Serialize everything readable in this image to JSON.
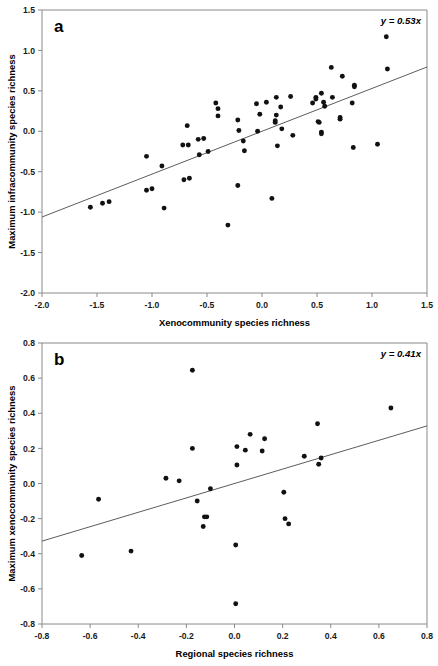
{
  "figure": {
    "type": "scatter-figure",
    "panel_count": 2,
    "background_color": "#ffffff",
    "point_color": "#111111",
    "line_color": "#4a4a4a",
    "axis_color": "#8a8a8a"
  },
  "chart_data": [
    {
      "type": "scatter",
      "panel_label": "a",
      "title": "",
      "xlabel": "Xenocommunity species richness",
      "ylabel": "Maximum infracommunity species richness",
      "xlim": [
        -2.0,
        1.5
      ],
      "ylim": [
        -2.0,
        1.5
      ],
      "xticks": [
        -2.0,
        -1.5,
        -1.0,
        -0.5,
        0.0,
        0.5,
        1.0,
        1.5
      ],
      "xtick_labels": [
        "-2.0",
        "-1.5",
        "-1.0",
        "-0.5",
        "0.0",
        "0.5",
        "1.0",
        "1.5"
      ],
      "yticks": [
        -2.0,
        -1.5,
        -1.0,
        -0.5,
        0.0,
        0.5,
        1.0,
        1.5
      ],
      "ytick_labels": [
        "-2.0",
        "-1.5",
        "-1.0",
        "-0.5",
        "0.0",
        "0.5",
        "1.0",
        "1.5"
      ],
      "grid": false,
      "legend": "none",
      "annotation": "y = 0.53x",
      "annotation_position": "top-right",
      "fit": {
        "equation": "y = 0.53x",
        "slope": 0.53,
        "intercept": 0.0
      },
      "points": [
        [
          -1.56,
          -0.94
        ],
        [
          -1.45,
          -0.89
        ],
        [
          -1.39,
          -0.87
        ],
        [
          -1.05,
          -0.31
        ],
        [
          -1.05,
          -0.73
        ],
        [
          -1.0,
          -0.71
        ],
        [
          -0.91,
          -0.43
        ],
        [
          -0.89,
          -0.95
        ],
        [
          -0.72,
          -0.17
        ],
        [
          -0.71,
          -0.6
        ],
        [
          -0.68,
          0.07
        ],
        [
          -0.67,
          -0.17
        ],
        [
          -0.66,
          -0.58
        ],
        [
          -0.58,
          -0.1
        ],
        [
          -0.57,
          -0.29
        ],
        [
          -0.53,
          -0.09
        ],
        [
          -0.49,
          -0.25
        ],
        [
          -0.42,
          0.35
        ],
        [
          -0.4,
          0.28
        ],
        [
          -0.4,
          0.19
        ],
        [
          -0.31,
          -1.16
        ],
        [
          -0.22,
          0.14
        ],
        [
          -0.22,
          -0.67
        ],
        [
          -0.21,
          0.01
        ],
        [
          -0.17,
          -0.12
        ],
        [
          -0.16,
          -0.24
        ],
        [
          -0.05,
          0.34
        ],
        [
          -0.04,
          0.0
        ],
        [
          -0.02,
          0.21
        ],
        [
          0.04,
          0.36
        ],
        [
          0.09,
          -0.83
        ],
        [
          0.12,
          0.13
        ],
        [
          0.12,
          0.11
        ],
        [
          0.13,
          0.42
        ],
        [
          0.13,
          0.2
        ],
        [
          0.14,
          -0.18
        ],
        [
          0.17,
          0.3
        ],
        [
          0.18,
          0.03
        ],
        [
          0.26,
          0.43
        ],
        [
          0.28,
          -0.05
        ],
        [
          0.46,
          0.35
        ],
        [
          0.49,
          0.42
        ],
        [
          0.49,
          0.4
        ],
        [
          0.51,
          0.12
        ],
        [
          0.52,
          0.11
        ],
        [
          0.54,
          0.47
        ],
        [
          0.54,
          -0.01
        ],
        [
          0.54,
          -0.03
        ],
        [
          0.56,
          0.36
        ],
        [
          0.57,
          0.31
        ],
        [
          0.63,
          0.79
        ],
        [
          0.64,
          0.42
        ],
        [
          0.71,
          0.17
        ],
        [
          0.71,
          0.15
        ],
        [
          0.73,
          0.68
        ],
        [
          0.82,
          0.35
        ],
        [
          0.83,
          -0.2
        ],
        [
          0.84,
          0.57
        ],
        [
          0.84,
          0.55
        ],
        [
          1.05,
          -0.16
        ],
        [
          1.13,
          1.17
        ],
        [
          1.14,
          0.77
        ]
      ]
    },
    {
      "type": "scatter",
      "panel_label": "b",
      "title": "",
      "xlabel": "Regional species richness",
      "ylabel": "Maximum xenocommunity species richness",
      "xlim": [
        -0.8,
        0.8
      ],
      "ylim": [
        -0.8,
        0.8
      ],
      "xticks": [
        -0.8,
        -0.6,
        -0.4,
        -0.2,
        0.0,
        0.2,
        0.4,
        0.6,
        0.8
      ],
      "xtick_labels": [
        "-0.8",
        "-0.6",
        "-0.4",
        "-0.2",
        "0.0",
        "0.2",
        "0.4",
        "0.6",
        "0.8"
      ],
      "yticks": [
        -0.8,
        -0.6,
        -0.4,
        -0.2,
        0.0,
        0.2,
        0.4,
        0.6,
        0.8
      ],
      "ytick_labels": [
        "-0.8",
        "-0.6",
        "-0.4",
        "-0.2",
        "0.0",
        "0.2",
        "0.4",
        "0.6",
        "0.8"
      ],
      "grid": false,
      "legend": "none",
      "annotation": "y = 0.41x",
      "annotation_position": "top-right",
      "fit": {
        "equation": "y = 0.41x",
        "slope": 0.41,
        "intercept": 0.0
      },
      "points": [
        [
          -0.635,
          -0.41
        ],
        [
          -0.565,
          -0.09
        ],
        [
          -0.43,
          -0.385
        ],
        [
          -0.285,
          0.03
        ],
        [
          -0.23,
          0.015
        ],
        [
          -0.175,
          0.645
        ],
        [
          -0.175,
          0.2
        ],
        [
          -0.155,
          -0.1
        ],
        [
          -0.13,
          -0.245
        ],
        [
          -0.125,
          -0.19
        ],
        [
          -0.115,
          -0.19
        ],
        [
          -0.1,
          -0.03
        ],
        [
          0.005,
          -0.35
        ],
        [
          0.005,
          -0.685
        ],
        [
          0.01,
          0.21
        ],
        [
          0.01,
          0.105
        ],
        [
          0.045,
          0.19
        ],
        [
          0.065,
          0.28
        ],
        [
          0.115,
          0.185
        ],
        [
          0.125,
          0.255
        ],
        [
          0.205,
          -0.05
        ],
        [
          0.21,
          -0.2
        ],
        [
          0.225,
          -0.23
        ],
        [
          0.29,
          0.155
        ],
        [
          0.345,
          0.34
        ],
        [
          0.35,
          0.11
        ],
        [
          0.36,
          0.145
        ],
        [
          0.65,
          0.43
        ]
      ]
    }
  ],
  "panels": {
    "a": {
      "letter": "a",
      "xlabel": "Xenocommunity species richness",
      "ylabel": "Maximum infracommunity species richness",
      "equation": "y = 0.53x",
      "xtick_labels": [
        "-2.0",
        "-1.5",
        "-1.0",
        "-0.5",
        "0.0",
        "0.5",
        "1.0",
        "1.5"
      ],
      "ytick_labels": [
        "1.5",
        "1.0",
        "0.5",
        "0.0",
        "-0.5",
        "-1.0",
        "-1.5",
        "-2.0"
      ]
    },
    "b": {
      "letter": "b",
      "xlabel": "Regional species richness",
      "ylabel": "Maximum xenocommunity species richness",
      "equation": "y = 0.41x",
      "xtick_labels": [
        "-0.8",
        "-0.6",
        "-0.4",
        "-0.2",
        "0.0",
        "0.2",
        "0.4",
        "0.6",
        "0.8"
      ],
      "ytick_labels": [
        "0.8",
        "0.6",
        "0.4",
        "0.2",
        "0.0",
        "-0.2",
        "-0.4",
        "-0.6",
        "-0.8"
      ]
    }
  }
}
